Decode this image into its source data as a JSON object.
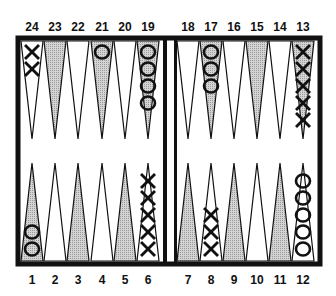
{
  "colors": {
    "frame": "#111111",
    "shaded_point": "#c8c8c8",
    "light_point": "#ffffff"
  },
  "top_labels": [
    "24",
    "23",
    "22",
    "21",
    "20",
    "19",
    "18",
    "17",
    "16",
    "15",
    "14",
    "13"
  ],
  "bottom_labels": [
    "1",
    "2",
    "3",
    "4",
    "5",
    "6",
    "7",
    "8",
    "9",
    "10",
    "11",
    "12"
  ],
  "points": [
    {
      "point": 24,
      "checker": "X",
      "count": 2
    },
    {
      "point": 21,
      "checker": "O",
      "count": 1
    },
    {
      "point": 19,
      "checker": "O",
      "count": 4
    },
    {
      "point": 17,
      "checker": "O",
      "count": 3
    },
    {
      "point": 13,
      "checker": "X",
      "count": 5
    },
    {
      "point": 1,
      "checker": "O",
      "count": 2
    },
    {
      "point": 6,
      "checker": "X",
      "count": 5
    },
    {
      "point": 8,
      "checker": "X",
      "count": 3
    },
    {
      "point": 12,
      "checker": "O",
      "count": 5
    }
  ]
}
